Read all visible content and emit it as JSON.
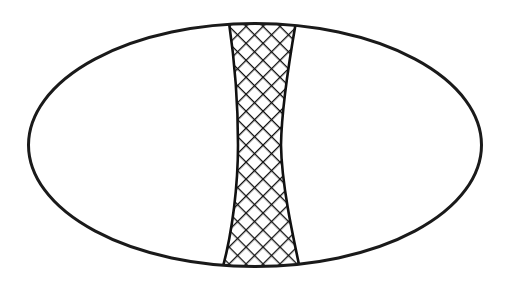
{
  "figure": {
    "title": "",
    "caption": "",
    "background_color": "#ffffff",
    "stroke_color": "#1a1a1a",
    "hatch_color": "#111111",
    "fill_color": "#ffffff",
    "canvas": {
      "width": 511,
      "height": 285
    },
    "ellipse": {
      "name": "outer-ellipse",
      "center_x": 255,
      "center_y": 145,
      "radius_x": 228,
      "radius_y": 123,
      "stroke_width": 3
    },
    "band": {
      "name": "hatched-band",
      "description": "vertical hourglass band with concave sides spanning the ellipse from top to bottom",
      "pattern": "crosshatch",
      "hatch_spacing": 12,
      "hatch_line_width": 2.6,
      "stroke_width": 2.6,
      "top_left_x": 228,
      "top_right_x": 297,
      "bottom_left_x": 222,
      "bottom_right_x": 300,
      "waist_left_x": 238,
      "waist_right_x": 281,
      "waist_y": 145,
      "top_y": 22,
      "bottom_y": 268
    }
  }
}
